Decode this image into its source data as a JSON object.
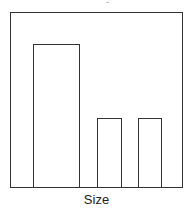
{
  "chart_data": {
    "type": "bar",
    "title": "",
    "xlabel": "Size",
    "ylabel": "",
    "categories": [
      "",
      "",
      ""
    ],
    "values": [
      1.0,
      0.48,
      0.48
    ],
    "value_note": "relative heights; no y-axis ticks shown",
    "grid": false,
    "legend": null,
    "bar_fill": "#ffffff",
    "bar_edge": "#333333",
    "bars_px": [
      {
        "left": 33,
        "right": 79,
        "top": 44
      },
      {
        "left": 97,
        "right": 121,
        "top": 118
      },
      {
        "left": 138,
        "right": 161,
        "top": 118
      }
    ],
    "baseline_px": 187
  },
  "axes": {
    "x_label": "Size"
  }
}
